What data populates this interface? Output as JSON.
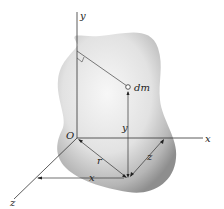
{
  "diagram": {
    "type": "3d-coordinate-body",
    "labels": {
      "y_axis": "y",
      "x_axis": "x",
      "z_axis": "z",
      "origin": "O",
      "mass_element": "dm",
      "y_dist": "y",
      "r_dist": "r",
      "x_dist": "x",
      "z_dist": "z"
    },
    "colors": {
      "line": "#333333",
      "body_light": "#f4f4f4",
      "body_dark": "#9a9a9a"
    }
  }
}
